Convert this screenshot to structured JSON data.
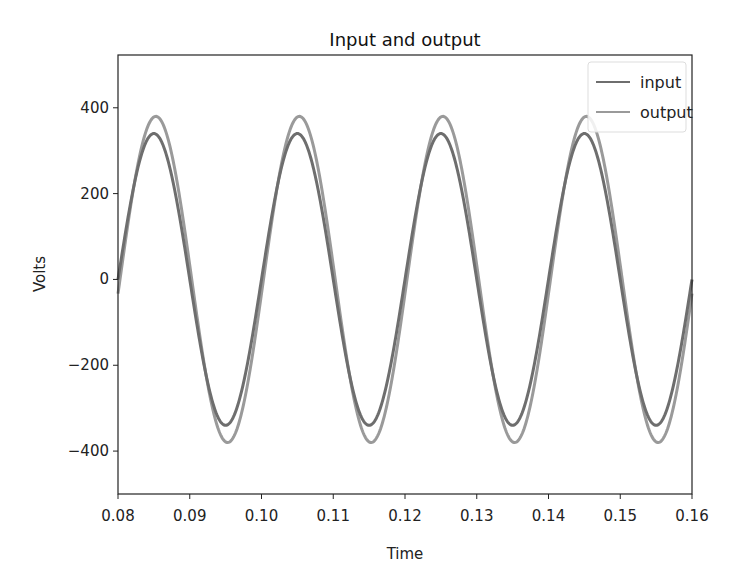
{
  "chart_data": {
    "type": "line",
    "title": "Input and output",
    "xlabel": "Time",
    "ylabel": "Volts",
    "xlim": [
      0.08,
      0.16
    ],
    "ylim": [
      -500,
      523
    ],
    "grid": false,
    "legend_position": "upper right",
    "x_ticks": [
      "0.08",
      "0.09",
      "0.10",
      "0.11",
      "0.12",
      "0.13",
      "0.14",
      "0.15",
      "0.16"
    ],
    "y_ticks": [
      "400",
      "200",
      "0",
      "−200",
      "−400"
    ],
    "x_tick_values": [
      0.08,
      0.09,
      0.1,
      0.11,
      0.12,
      0.13,
      0.14,
      0.15,
      0.16
    ],
    "y_tick_values": [
      400,
      200,
      0,
      -200,
      -400
    ],
    "series": [
      {
        "name": "input",
        "color": "#6e6e6e",
        "amplitude": 340,
        "frequency_hz": 50,
        "phase_deg": 0,
        "x": [
          0.08,
          0.0825,
          0.085,
          0.0875,
          0.09,
          0.0925,
          0.095,
          0.0975,
          0.1,
          0.1025,
          0.105,
          0.1075,
          0.11,
          0.1125,
          0.115,
          0.1175,
          0.12,
          0.1225,
          0.125,
          0.1275,
          0.13,
          0.1325,
          0.135,
          0.1375,
          0.14,
          0.1425,
          0.145,
          0.1475,
          0.15,
          0.1525,
          0.155,
          0.1575,
          0.16
        ],
        "values": [
          0,
          240,
          340,
          240,
          0,
          -240,
          -340,
          -240,
          0,
          240,
          340,
          240,
          0,
          -240,
          -340,
          -240,
          0,
          240,
          340,
          240,
          0,
          -240,
          -340,
          -240,
          0,
          240,
          340,
          240,
          0,
          -240,
          -340,
          -240,
          0
        ]
      },
      {
        "name": "output",
        "color": "#9a9a9a",
        "amplitude": 380,
        "frequency_hz": 50,
        "phase_deg": -5,
        "x": [
          0.08,
          0.0825,
          0.085,
          0.0875,
          0.09,
          0.0925,
          0.095,
          0.0975,
          0.1,
          0.1025,
          0.105,
          0.1075,
          0.11,
          0.1125,
          0.115,
          0.1175,
          0.12,
          0.1225,
          0.125,
          0.1275,
          0.13,
          0.1325,
          0.135,
          0.1375,
          0.14,
          0.1425,
          0.145,
          0.1475,
          0.15,
          0.1525,
          0.155,
          0.1575,
          0.16
        ],
        "values": [
          -33,
          244,
          379,
          293,
          33,
          -244,
          -379,
          -293,
          -33,
          244,
          379,
          293,
          33,
          -244,
          -379,
          -293,
          -33,
          244,
          379,
          293,
          33,
          -244,
          -379,
          -293,
          -33,
          244,
          379,
          293,
          33,
          -244,
          -379,
          -293,
          -33
        ]
      }
    ]
  }
}
